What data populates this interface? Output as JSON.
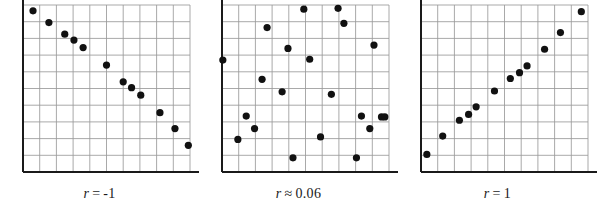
{
  "figure": {
    "name": "correlation-coefficient-scatterplots",
    "background_color": "#ffffff",
    "point_color": "#111111",
    "grid_color": "#9a9a9a",
    "axis_color": "#1a1a1a",
    "point_radius": 3.6
  },
  "chart_data": [
    {
      "type": "scatter",
      "title": "",
      "subtitle": "",
      "xlabel": "",
      "ylabel": "",
      "caption": "r = -1",
      "caption_symbol": "r",
      "caption_operator": "=",
      "caption_value": "-1",
      "r": -1,
      "grid": true,
      "grid_cols": 10,
      "grid_rows": 10,
      "xlim": [
        0,
        10
      ],
      "ylim": [
        0,
        10
      ],
      "tick_labels_x": [],
      "tick_labels_y": [],
      "legend": null,
      "x": [
        0.6,
        1.55,
        2.5,
        3.05,
        3.6,
        5.0,
        6.0,
        6.5,
        7.05,
        8.2,
        9.1,
        9.9
      ],
      "y": [
        9.65,
        8.95,
        8.25,
        7.9,
        7.45,
        6.4,
        5.4,
        5.05,
        4.6,
        3.55,
        2.6,
        1.6
      ]
    },
    {
      "type": "scatter",
      "title": "",
      "subtitle": "",
      "xlabel": "",
      "ylabel": "",
      "caption": "r ≈ 0.06",
      "caption_symbol": "r",
      "caption_operator": "≈",
      "caption_value": "0.06",
      "r": 0.06,
      "grid": true,
      "grid_cols": 10,
      "grid_rows": 10,
      "xlim": [
        0,
        10
      ],
      "ylim": [
        0,
        10
      ],
      "tick_labels_x": [],
      "tick_labels_y": [],
      "legend": null,
      "x": [
        0.05,
        0.95,
        1.45,
        1.95,
        2.4,
        2.7,
        3.6,
        3.95,
        4.25,
        4.9,
        5.25,
        5.9,
        6.55,
        6.95,
        7.3,
        8.05,
        8.35,
        8.85,
        9.1,
        9.55,
        9.75
      ],
      "y": [
        6.7,
        1.95,
        3.35,
        2.6,
        5.55,
        8.65,
        4.8,
        7.4,
        0.85,
        9.75,
        6.75,
        2.1,
        4.65,
        9.8,
        8.9,
        0.85,
        3.35,
        2.6,
        7.6,
        3.3,
        3.3
      ]
    },
    {
      "type": "scatter",
      "title": "",
      "subtitle": "",
      "xlabel": "",
      "ylabel": "",
      "caption": "r = 1",
      "caption_symbol": "r",
      "caption_operator": "=",
      "caption_value": "1",
      "r": 1,
      "grid": true,
      "grid_cols": 10,
      "grid_rows": 10,
      "xlim": [
        0,
        10
      ],
      "ylim": [
        0,
        10
      ],
      "tick_labels_x": [],
      "tick_labels_y": [],
      "legend": null,
      "x": [
        0.35,
        1.3,
        2.3,
        2.85,
        3.3,
        4.4,
        5.35,
        5.9,
        6.35,
        7.4,
        8.35,
        9.6
      ],
      "y": [
        1.05,
        2.15,
        3.1,
        3.45,
        3.9,
        4.85,
        5.6,
        5.95,
        6.35,
        7.35,
        8.35,
        9.6
      ]
    }
  ],
  "panels": [
    {
      "id": "panel-r-negative-one",
      "caption_symbol": "r",
      "caption_operator": "=",
      "caption_value": "-1"
    },
    {
      "id": "panel-r-approx-zero",
      "caption_symbol": "r",
      "caption_operator": "≈",
      "caption_value": "0.06"
    },
    {
      "id": "panel-r-positive-one",
      "caption_symbol": "r",
      "caption_operator": "=",
      "caption_value": "1"
    }
  ]
}
